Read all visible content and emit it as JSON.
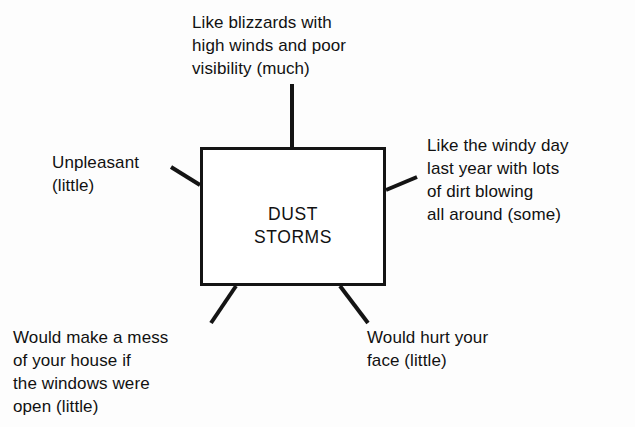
{
  "diagram": {
    "type": "concept-map",
    "center": {
      "label": "DUST\nSTORMS"
    },
    "branches": [
      {
        "id": "top",
        "position": "top",
        "text": "Like blizzards with\nhigh winds and poor\nvisibility (much)",
        "magnitude": "much"
      },
      {
        "id": "right",
        "position": "right",
        "text": "Like the windy day\nlast year with lots\nof dirt blowing\nall around (some)",
        "magnitude": "some"
      },
      {
        "id": "left",
        "position": "left",
        "text": "Unpleasant\n(little)",
        "magnitude": "little"
      },
      {
        "id": "bottom-left",
        "position": "bottom-left",
        "text": "Would make a mess\nof your house if\nthe windows were\nopen (little)",
        "magnitude": "little"
      },
      {
        "id": "bottom-right",
        "position": "bottom-right",
        "text": "Would hurt your\nface (little)",
        "magnitude": "little"
      }
    ],
    "colors": {
      "background": "#fdfdfd",
      "ink": "#111111",
      "box_border": "#141414",
      "box_fill": "#ffffff"
    }
  }
}
